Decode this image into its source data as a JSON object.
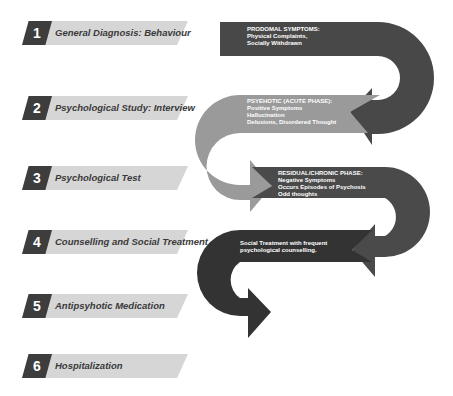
{
  "steps": [
    {
      "number": "1",
      "label": "General Diagnosis: Behaviour"
    },
    {
      "number": "2",
      "label": "Psychological Study: Interview"
    },
    {
      "number": "3",
      "label": "Psychological Test"
    },
    {
      "number": "4",
      "label": "Counselling and Social Treatment"
    },
    {
      "number": "5",
      "label": "Antipsyhotic Medication"
    },
    {
      "number": "6",
      "label": "Hospitalization"
    }
  ],
  "phases": [
    {
      "title": "PRODOMAL SYMPTOMS:",
      "lines": [
        "Physical Complaints,",
        "Socially Withdrawn"
      ],
      "color": "#484848"
    },
    {
      "title": "PSYEHOTIC (ACUTE PHASE):",
      "lines": [
        "Positive Symptoms",
        "Hallucination",
        "Delusions, Disordered Thought"
      ],
      "color": "#9a9a9a"
    },
    {
      "title": "RESIDUAL/CHRONIC PHASE:",
      "lines": [
        "Negative Symptoms",
        "Occurs Episodes of Psychosis",
        "Odd thoughts"
      ],
      "color": "#4a4a4a"
    },
    {
      "title": "",
      "lines": [
        "Social Treatment with frequent",
        "psychological counselling."
      ],
      "color": "#333333"
    }
  ]
}
